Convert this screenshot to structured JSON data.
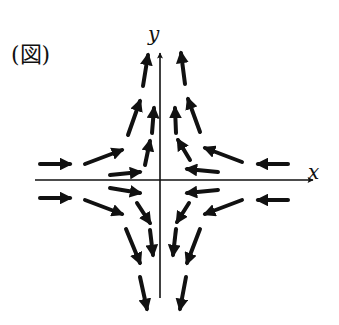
{
  "figure": {
    "label": "(図)",
    "x_axis_label": "x",
    "y_axis_label": "y",
    "colors": {
      "ink": "#111111",
      "background": "#ffffff"
    },
    "axes": {
      "x": {
        "x1": 35,
        "y1": 180,
        "x2": 313,
        "y2": 180
      },
      "y": {
        "x1": 160,
        "y1": 298,
        "x2": 160,
        "y2": 53
      }
    },
    "arrows": [
      {
        "q": "upper-left",
        "x1": 143,
        "y1": 86,
        "x2": 148,
        "y2": 55
      },
      {
        "q": "upper-left",
        "x1": 128,
        "y1": 135,
        "x2": 140,
        "y2": 101
      },
      {
        "q": "upper-left",
        "x1": 152,
        "y1": 133,
        "x2": 154,
        "y2": 108
      },
      {
        "q": "upper-left",
        "x1": 145,
        "y1": 165,
        "x2": 150,
        "y2": 141
      },
      {
        "q": "upper-left",
        "x1": 40,
        "y1": 164,
        "x2": 70,
        "y2": 164
      },
      {
        "q": "upper-left",
        "x1": 85,
        "y1": 164,
        "x2": 122,
        "y2": 150
      },
      {
        "q": "upper-left",
        "x1": 110,
        "y1": 175,
        "x2": 140,
        "y2": 172
      },
      {
        "q": "upper-right",
        "x1": 185,
        "y1": 84,
        "x2": 181,
        "y2": 53
      },
      {
        "q": "upper-right",
        "x1": 200,
        "y1": 132,
        "x2": 188,
        "y2": 99
      },
      {
        "q": "upper-right",
        "x1": 176,
        "y1": 133,
        "x2": 175,
        "y2": 108
      },
      {
        "q": "upper-right",
        "x1": 190,
        "y1": 160,
        "x2": 178,
        "y2": 140
      },
      {
        "q": "upper-right",
        "x1": 288,
        "y1": 164,
        "x2": 258,
        "y2": 164
      },
      {
        "q": "upper-right",
        "x1": 242,
        "y1": 162,
        "x2": 205,
        "y2": 148
      },
      {
        "q": "upper-right",
        "x1": 218,
        "y1": 172,
        "x2": 187,
        "y2": 169
      },
      {
        "q": "lower-left",
        "x1": 40,
        "y1": 198,
        "x2": 70,
        "y2": 198
      },
      {
        "q": "lower-left",
        "x1": 85,
        "y1": 200,
        "x2": 122,
        "y2": 214
      },
      {
        "q": "lower-left",
        "x1": 110,
        "y1": 188,
        "x2": 140,
        "y2": 193
      },
      {
        "q": "lower-left",
        "x1": 137,
        "y1": 203,
        "x2": 150,
        "y2": 223
      },
      {
        "q": "lower-left",
        "x1": 150,
        "y1": 230,
        "x2": 153,
        "y2": 255
      },
      {
        "q": "lower-left",
        "x1": 126,
        "y1": 229,
        "x2": 140,
        "y2": 263
      },
      {
        "q": "lower-left",
        "x1": 140,
        "y1": 277,
        "x2": 147,
        "y2": 309
      },
      {
        "q": "lower-right",
        "x1": 288,
        "y1": 200,
        "x2": 258,
        "y2": 200
      },
      {
        "q": "lower-right",
        "x1": 242,
        "y1": 200,
        "x2": 205,
        "y2": 214
      },
      {
        "q": "lower-right",
        "x1": 218,
        "y1": 190,
        "x2": 187,
        "y2": 193
      },
      {
        "q": "lower-right",
        "x1": 189,
        "y1": 203,
        "x2": 177,
        "y2": 222
      },
      {
        "q": "lower-right",
        "x1": 176,
        "y1": 229,
        "x2": 173,
        "y2": 255
      },
      {
        "q": "lower-right",
        "x1": 200,
        "y1": 229,
        "x2": 187,
        "y2": 263
      },
      {
        "q": "lower-right",
        "x1": 186,
        "y1": 277,
        "x2": 180,
        "y2": 309
      }
    ]
  }
}
